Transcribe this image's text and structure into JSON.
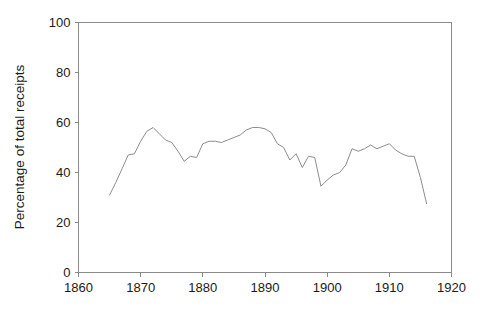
{
  "chart_data": {
    "type": "line",
    "title": "",
    "xlabel": "",
    "ylabel": "Percentage of total receipts",
    "xlim": [
      1860,
      1920
    ],
    "ylim": [
      0,
      100
    ],
    "xticks": [
      1860,
      1870,
      1880,
      1890,
      1900,
      1910,
      1920
    ],
    "xtick_labels": [
      "1860",
      "1870",
      "1880",
      "1890",
      "1900",
      "1910",
      "1920"
    ],
    "yticks": [
      0,
      20,
      40,
      60,
      80,
      100
    ],
    "ytick_labels": [
      "0",
      "20",
      "40",
      "60",
      "80",
      "100"
    ],
    "grid": false,
    "legend": "none",
    "line_color": "#8c8c8c",
    "axis_color": "#8a8a8a",
    "text_color": "#1a1a1a",
    "background": "#ffffff",
    "series": [
      {
        "name": "Percentage of total receipts",
        "x": [
          1865,
          1866,
          1867,
          1868,
          1869,
          1870,
          1871,
          1872,
          1873,
          1874,
          1875,
          1876,
          1877,
          1878,
          1879,
          1880,
          1881,
          1882,
          1883,
          1884,
          1885,
          1886,
          1887,
          1888,
          1889,
          1890,
          1891,
          1892,
          1893,
          1894,
          1895,
          1896,
          1897,
          1898,
          1899,
          1900,
          1901,
          1902,
          1903,
          1904,
          1905,
          1906,
          1907,
          1908,
          1909,
          1910,
          1911,
          1912,
          1913,
          1914,
          1915,
          1916
        ],
        "y": [
          31.0,
          36.0,
          41.5,
          47.0,
          47.5,
          52.5,
          56.5,
          58.0,
          55.5,
          53.0,
          52.0,
          48.5,
          44.5,
          46.5,
          46.0,
          51.5,
          52.5,
          52.5,
          52.0,
          53.0,
          54.0,
          55.0,
          57.0,
          58.0,
          58.0,
          57.5,
          56.0,
          51.5,
          50.0,
          45.0,
          47.5,
          42.0,
          46.5,
          46.0,
          34.5,
          37.0,
          39.0,
          40.0,
          43.0,
          49.5,
          48.5,
          49.5,
          51.0,
          49.5,
          50.5,
          51.5,
          49.0,
          47.5,
          46.5,
          46.5,
          38.0,
          27.5
        ]
      }
    ]
  },
  "axes": {
    "ylabel": "Percentage of total receipts"
  }
}
